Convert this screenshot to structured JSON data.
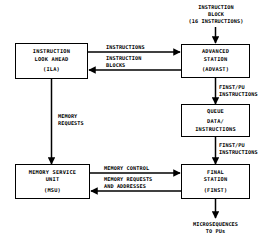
{
  "diagram": {
    "type": "block-diagram",
    "stroke_color": "#000000",
    "background_color": "#ffffff",
    "blocks": [
      {
        "id": "ila",
        "name": "instruction-look-ahead",
        "line1": "INSTRUCTION",
        "line2": "LOOK AHEAD",
        "abbrev": "(ILA)"
      },
      {
        "id": "advast",
        "name": "advanced-station",
        "line1": "ADVANCED",
        "line2": "STATION",
        "abbrev": "(ADVAST)"
      },
      {
        "id": "queue",
        "name": "queue",
        "line1": "QUEUE",
        "line2": "DATA/",
        "line3": "INSTRUCTIONS"
      },
      {
        "id": "msu",
        "name": "memory-service-unit",
        "line1": "MEMORY SERVICE",
        "line2": "UNIT",
        "abbrev": "(MSU)"
      },
      {
        "id": "finst",
        "name": "final-station",
        "line1": "FINAL",
        "line2": "STATION",
        "abbrev": "(FINST)"
      }
    ],
    "labels": {
      "input_top": {
        "line1": "INSTRUCTION",
        "line2": "BLOCK",
        "line3": "(16 INSTRUCTIONS)"
      },
      "ila_to_advast": {
        "line1": "INSTRUCTIONS"
      },
      "advast_to_ila": {
        "line1": "INSTRUCTION",
        "line2": "BLOCKS"
      },
      "advast_to_queue": {
        "line1": "FINST/PU",
        "line2": "INSTRUCTIONS"
      },
      "queue_to_finst": {
        "line1": "FINST/PU",
        "line2": "INSTRUCTIONS"
      },
      "ila_to_msu": {
        "line1": "MEMORY",
        "line2": "REQUESTS"
      },
      "msu_to_finst": {
        "line1": "MEMORY CONTROL"
      },
      "finst_to_msu": {
        "line1": "MEMORY REQUESTS",
        "line2": "AND ADDRESSES"
      },
      "output_bottom": {
        "line1": "MICROSEQUENCES",
        "line2": "TO PUs"
      }
    }
  }
}
